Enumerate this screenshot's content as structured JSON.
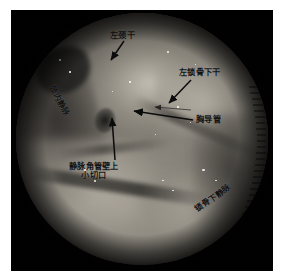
{
  "image": {
    "kind": "endoscopic-surgical-photograph",
    "modality": "endoscopy",
    "view": "circular scope field",
    "color_mode": "grayscale",
    "frame_color": "#050505",
    "page_background": "#ffffff",
    "tissue_base_color": "#7e7a72",
    "annotation_color": "#121212"
  },
  "annotations": {
    "label_left_jugular_trunk": "左颈干",
    "label_left_subclavian_trunk": "左锁骨下干",
    "label_thoracic_duct": "胸导管",
    "label_internal_jugular_vein": "颈内静脉",
    "label_venous_angle_incision": "静脉角管壁上\n小切口",
    "label_subclavian_vein": "锁骨下静脉"
  },
  "arrows": [
    {
      "name": "arrow-to-left-jugular-trunk",
      "direction": "down-left"
    },
    {
      "name": "arrow-to-left-subclavian-trunk",
      "direction": "down-left"
    },
    {
      "name": "arrow-to-thoracic-duct",
      "direction": "left"
    },
    {
      "name": "arrow-to-thoracic-duct-secondary",
      "direction": "left"
    },
    {
      "name": "arrow-to-venous-angle-incision",
      "direction": "up"
    }
  ],
  "scope_overlay": {
    "ruler_ticks": 22,
    "ruler_position": "right-edge"
  }
}
